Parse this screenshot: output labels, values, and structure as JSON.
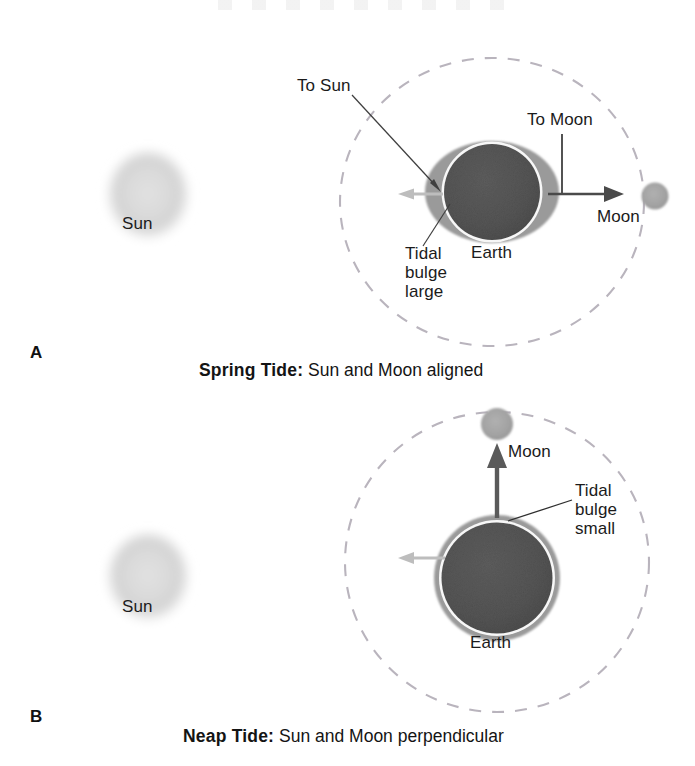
{
  "figure": {
    "title_hidden": "",
    "background": "#ffffff"
  },
  "colors": {
    "earth_core": "#555555",
    "earth_bulge": "#9a9a9a",
    "sun_fill": "#d8d8d8",
    "moon_fill": "#a6a6a6",
    "orbit_dash": "#b9b4bd",
    "arrow_dark": "#4a4a4a",
    "arrow_light": "#b3b3b3",
    "leader_line": "#3a3a3a",
    "text": "#1b1b1b"
  },
  "panels": [
    {
      "letter": "A",
      "caption_label": "Spring Tide:",
      "caption_desc": "Sun and Moon aligned",
      "sun_label": "Sun",
      "earth_label": "Earth",
      "moon_label": "Moon",
      "to_sun_label": "To Sun",
      "to_moon_label": "To Moon",
      "bulge_label": "Tidal bulge large",
      "bulge_label_lines": [
        "Tidal",
        "bulge",
        "large"
      ]
    },
    {
      "letter": "B",
      "caption_label": "Neap Tide:",
      "caption_desc": "Sun and Moon perpendicular",
      "sun_label": "Sun",
      "earth_label": "Earth",
      "moon_label": "Moon",
      "to_sun_label": "",
      "to_moon_label": "",
      "bulge_label": "Tidal bulge small",
      "bulge_label_lines": [
        "Tidal",
        "bulge",
        "small"
      ]
    }
  ],
  "diagram_data": {
    "type": "diagram",
    "subject": "Tides: spring tide versus neap tide geometry",
    "panel_a": {
      "description": "Sun and Moon aligned producing large tidal bulge",
      "sun": {
        "cx": 148,
        "cy": 197,
        "rx": 39,
        "ry": 43
      },
      "orbit": {
        "cx": 492,
        "cy": 202,
        "rx": 152,
        "ry": 144
      },
      "earth": {
        "cx": 492,
        "cy": 192,
        "r": 49
      },
      "bulge": {
        "cx": 492,
        "cy": 192,
        "rx": 66,
        "ry": 50
      },
      "moon": {
        "cx": 655,
        "cy": 196,
        "r": 13
      },
      "arrow_to_sun": {
        "direction": "left",
        "color": "light"
      },
      "arrow_to_moon": {
        "direction": "right",
        "color": "dark"
      }
    },
    "panel_b": {
      "description": "Sun and Moon perpendicular producing small tidal bulge",
      "sun": {
        "cx": 148,
        "cy": 580,
        "rx": 39,
        "ry": 43
      },
      "orbit": {
        "cx": 497,
        "cy": 562,
        "rx": 152,
        "ry": 150
      },
      "earth": {
        "cx": 497,
        "cy": 578,
        "r": 56
      },
      "bulge": {
        "cx": 497,
        "cy": 578,
        "rx": 63,
        "ry": 63
      },
      "moon": {
        "cx": 497,
        "cy": 423,
        "r": 16
      },
      "arrow_to_moon": {
        "direction": "up",
        "color": "dark"
      },
      "arrow_to_sun": {
        "direction": "left",
        "color": "light"
      }
    }
  }
}
